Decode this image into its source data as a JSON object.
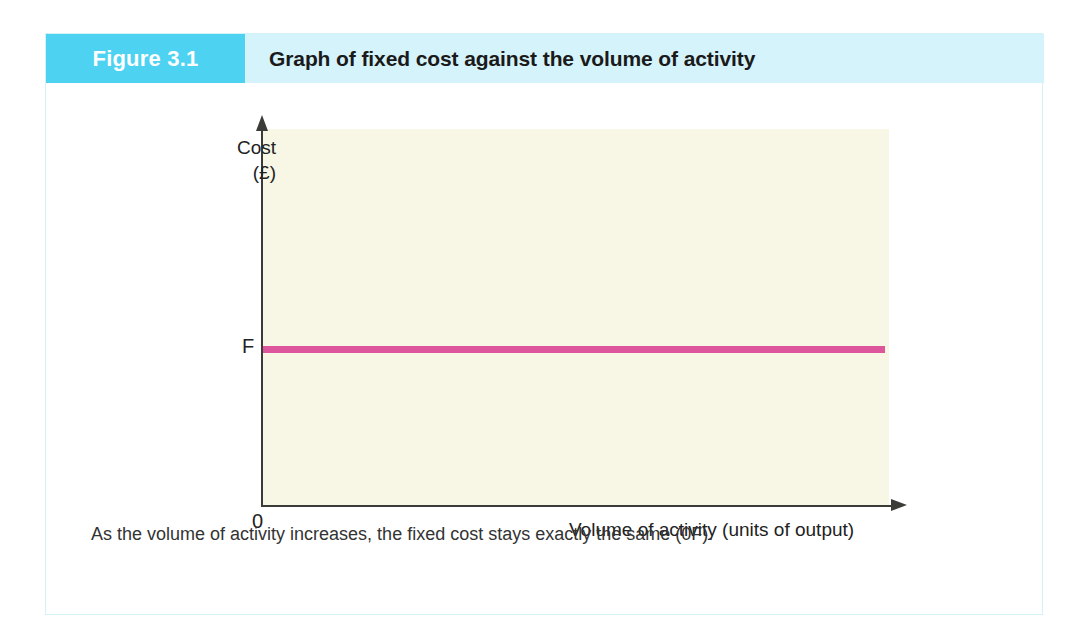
{
  "figure": {
    "number_label": "Figure 3.1",
    "title": "Graph of fixed cost against the volume of activity",
    "caption": "As the volume of activity increases, the fixed cost stays exactly the same (0F).",
    "header_block_color": "#4ed2f2",
    "header_bar_color": "#d5f3fa",
    "border_color": "#d4f1f7"
  },
  "chart_data": {
    "type": "line",
    "title": "Graph of fixed cost against the volume of activity",
    "subtitle": "",
    "xlabel": "Volume of activity (units of output)",
    "ylabel_lines": [
      "Cost",
      "(£)"
    ],
    "ylabel": "Cost (£)",
    "origin_label": "0",
    "grid": false,
    "legend": "none",
    "plot_background": "#f8f6e4",
    "axis_color": "#3b3b38",
    "xlim": [
      0,
      100
    ],
    "ylim": [
      0,
      100
    ],
    "xticks": [],
    "xticklabels": [],
    "yticks": [
      40
    ],
    "yticklabels": [
      "F"
    ],
    "annotations": [
      {
        "name": "fixed-cost-level",
        "text": "F",
        "y": 40,
        "description": "Fixed cost level on the vertical axis"
      }
    ],
    "series": [
      {
        "name": "Fixed cost",
        "color": "#dd569c",
        "linewidth": 7,
        "x": [
          0,
          100
        ],
        "values": [
          40,
          40
        ]
      }
    ]
  },
  "axis_labels": {
    "y_line1": "Cost",
    "y_line2": "(£)",
    "fixed_cost_marker": "F",
    "origin": "0",
    "x_title": "Volume of activity (units of output)"
  }
}
